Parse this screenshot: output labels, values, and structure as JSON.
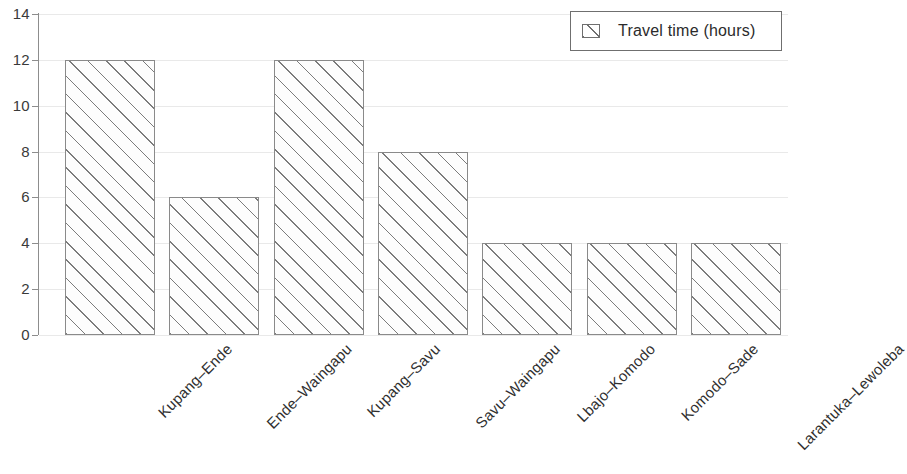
{
  "chart_data": {
    "type": "bar",
    "title": "",
    "subtitle": "",
    "xlabel": "",
    "ylabel": "",
    "ylim": [
      0,
      14
    ],
    "ytick_values": [
      0,
      2,
      4,
      6,
      8,
      10,
      12,
      14
    ],
    "ytick_labels": [
      "0",
      "2",
      "4",
      "6",
      "8",
      "10",
      "12",
      "14"
    ],
    "grid": true,
    "grid_axis": "y",
    "legend_position": "top-right",
    "legend_entries": [
      "Travel time (hours)"
    ],
    "categories": [
      "Kupang–Ende",
      "Ende–Waingapu",
      "Kupang–Savu",
      "Savu–Waingapu",
      "Lbajo–Komodo",
      "Komodo–Sade",
      "Larantuka–Lewoleba"
    ],
    "series": [
      {
        "name": "Travel time (hours)",
        "values": [
          12,
          6,
          12,
          8,
          4,
          4,
          4
        ],
        "fill": "hatch-diagonal-45",
        "edge_color": "#8a8a8a",
        "face_color": "#ffffff"
      }
    ],
    "xtick_label_rotation": 45,
    "bar_count": 7
  },
  "legend": {
    "label": "Travel time (hours)",
    "swatch_icon": "hatched-square-icon"
  },
  "axes": {
    "y_axis_color": "#8d8d8d",
    "gridline_color": "#e9e9e9",
    "background": "#ffffff"
  }
}
